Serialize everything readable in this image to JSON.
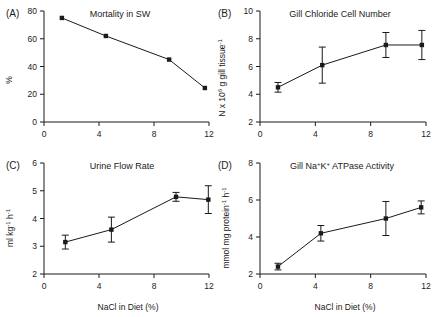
{
  "figure": {
    "panels": [
      "A",
      "B",
      "C",
      "D"
    ],
    "shared_xlabel": "NaCl in Diet (%)"
  },
  "labels": {
    "letter_a": "(A)",
    "letter_b": "(B)",
    "letter_c": "(C)",
    "letter_d": "(D)",
    "xlabel_c": "NaCl in Diet (%)",
    "xlabel_d": "NaCl in Diet (%)",
    "ylabel_a": "%",
    "ylabel_b_pre": "N x 10",
    "ylabel_b_sup": "6",
    "ylabel_b_mid": " g gill tissue",
    "ylabel_b_sup2": "-1",
    "ylabel_c_pre": "ml kg",
    "ylabel_c_sup": "-1",
    "ylabel_c_mid": " h",
    "ylabel_c_sup2": "-1",
    "ylabel_d_pre": "mmol mg protein",
    "ylabel_d_sup": "-1",
    "ylabel_d_mid": " h",
    "ylabel_d_sup2": "-1",
    "title_d_pre": "Gill Na",
    "title_d_sup1": "+",
    "title_d_mid": "K",
    "title_d_sup2": "+",
    "title_d_post": " ATPase Activity"
  },
  "chart_data": [
    {
      "panel": "A",
      "type": "line",
      "title": "Mortality in SW",
      "xlabel": "NaCl in Diet (%)",
      "ylabel": "%",
      "xlim": [
        0,
        12
      ],
      "ylim": [
        0,
        80
      ],
      "xticks": [
        0,
        4,
        8,
        12
      ],
      "yticks": [
        0,
        20,
        40,
        60,
        80
      ],
      "x": [
        1.3,
        4.5,
        9.1,
        11.7
      ],
      "values": [
        75,
        62,
        45,
        24.5
      ],
      "errors": [
        0,
        0,
        0,
        0
      ],
      "grid": false,
      "legend": "none"
    },
    {
      "panel": "B",
      "type": "line",
      "title": "Gill Chloride Cell Number",
      "xlabel": "NaCl in Diet (%)",
      "ylabel": "N x 10^6 g gill tissue^-1",
      "xlim": [
        0,
        12
      ],
      "ylim": [
        2,
        10
      ],
      "xticks": [
        0,
        4,
        8,
        12
      ],
      "yticks": [
        2,
        4,
        6,
        8,
        10
      ],
      "x": [
        1.3,
        4.5,
        9.1,
        11.7
      ],
      "values": [
        4.5,
        6.1,
        7.55,
        7.55
      ],
      "errors": [
        0.35,
        1.3,
        0.9,
        1.05
      ],
      "grid": false,
      "legend": "none"
    },
    {
      "panel": "C",
      "type": "line",
      "title": "Urine Flow Rate",
      "xlabel": "NaCl in Diet (%)",
      "ylabel": "ml kg^-1 h^-1",
      "xlim": [
        0,
        12
      ],
      "ylim": [
        2,
        6
      ],
      "xticks": [
        0,
        4,
        8,
        12
      ],
      "yticks": [
        2,
        3,
        4,
        5,
        6
      ],
      "x": [
        1.55,
        4.9,
        9.6,
        11.95
      ],
      "values": [
        3.15,
        3.6,
        4.78,
        4.68
      ],
      "errors": [
        0.25,
        0.45,
        0.16,
        0.5
      ],
      "grid": false,
      "legend": "none"
    },
    {
      "panel": "D",
      "type": "line",
      "title": "Gill Na+K+ ATPase Activity",
      "xlabel": "NaCl in Diet (%)",
      "ylabel": "mmol mg protein^-1 h^-1",
      "xlim": [
        0,
        12
      ],
      "ylim": [
        2,
        8
      ],
      "xticks": [
        0,
        4,
        8,
        12
      ],
      "yticks": [
        2,
        4,
        6,
        8
      ],
      "x": [
        1.3,
        4.4,
        9.1,
        11.65
      ],
      "values": [
        2.4,
        4.2,
        5.0,
        5.6
      ],
      "errors": [
        0.18,
        0.42,
        0.92,
        0.35
      ],
      "grid": false,
      "legend": "none"
    }
  ]
}
